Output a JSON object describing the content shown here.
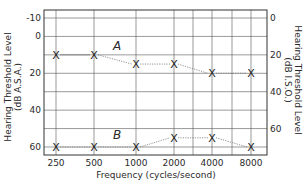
{
  "chart_data": {
    "type": "line",
    "title": "",
    "xlabel": "Frequency (cycles/second)",
    "ylabel_left": [
      "Hearing Threshold Level",
      "(dB A.S.A.)"
    ],
    "ylabel_right": [
      "Hearing Threshold Level",
      "(dB I.S.O.)"
    ],
    "categories": [
      "250",
      "500",
      "1000",
      "2000",
      "4000",
      "8000"
    ],
    "y_left_ticks": [
      -10,
      0,
      20,
      40,
      60
    ],
    "y_right_ticks": [
      0,
      20,
      40,
      60
    ],
    "ylim_left": [
      -10,
      60
    ],
    "y_inverted": true,
    "grid": true,
    "legend": "inline labels A and B",
    "marker": "X",
    "line_style": "dotted",
    "series": [
      {
        "name": "A",
        "values": [
          10,
          10,
          15,
          15,
          20,
          20
        ]
      },
      {
        "name": "B",
        "values": [
          60,
          60,
          60,
          55,
          55,
          60
        ]
      }
    ]
  },
  "labels": {
    "xlabel": "Frequency (cycles/second)",
    "ylabel_left_line1": "Hearing Threshold Level",
    "ylabel_left_line2": "(dB A.S.A.)",
    "ylabel_right_line1": "Hearing Threshold Level",
    "ylabel_right_line2": "(dB I.S.O.)",
    "series_a": "A",
    "series_b": "B"
  }
}
